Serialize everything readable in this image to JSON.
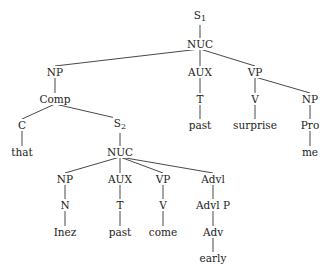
{
  "diagram": {
    "type": "syntax-tree",
    "nodes": [
      {
        "id": "s1",
        "label": "S",
        "sub": "1",
        "x": 200,
        "y": 17
      },
      {
        "id": "nuc1",
        "label": "NUC",
        "x": 200,
        "y": 44
      },
      {
        "id": "np1",
        "label": "NP",
        "x": 55,
        "y": 72
      },
      {
        "id": "aux1",
        "label": "AUX",
        "x": 200,
        "y": 72
      },
      {
        "id": "vp1",
        "label": "VP",
        "x": 255,
        "y": 72
      },
      {
        "id": "comp",
        "label": "Comp",
        "x": 55,
        "y": 99
      },
      {
        "id": "t1",
        "label": "T",
        "x": 200,
        "y": 99
      },
      {
        "id": "v1",
        "label": "V",
        "x": 255,
        "y": 99
      },
      {
        "id": "np2",
        "label": "NP",
        "x": 310,
        "y": 99
      },
      {
        "id": "c",
        "label": "C",
        "x": 22,
        "y": 125
      },
      {
        "id": "s2",
        "label": "S",
        "sub": "2",
        "x": 120,
        "y": 125
      },
      {
        "id": "past1",
        "label": "past",
        "x": 200,
        "y": 125
      },
      {
        "id": "surprise",
        "label": "surprise",
        "x": 255,
        "y": 125
      },
      {
        "id": "pro",
        "label": "Pro",
        "x": 310,
        "y": 125
      },
      {
        "id": "that",
        "label": "that",
        "x": 22,
        "y": 152
      },
      {
        "id": "nuc2",
        "label": "NUC",
        "x": 120,
        "y": 152
      },
      {
        "id": "me",
        "label": "me",
        "x": 310,
        "y": 152
      },
      {
        "id": "np3",
        "label": "NP",
        "x": 65,
        "y": 179
      },
      {
        "id": "aux2",
        "label": "AUX",
        "x": 120,
        "y": 179
      },
      {
        "id": "vp2",
        "label": "VP",
        "x": 163,
        "y": 179
      },
      {
        "id": "advl",
        "label": "Advl",
        "x": 213,
        "y": 179
      },
      {
        "id": "n",
        "label": "N",
        "x": 65,
        "y": 205
      },
      {
        "id": "t2",
        "label": "T",
        "x": 120,
        "y": 205
      },
      {
        "id": "v2",
        "label": "V",
        "x": 163,
        "y": 205
      },
      {
        "id": "advlp",
        "label": "Advl P",
        "x": 213,
        "y": 205
      },
      {
        "id": "inez",
        "label": "Inez",
        "x": 65,
        "y": 232
      },
      {
        "id": "past2",
        "label": "past",
        "x": 120,
        "y": 232
      },
      {
        "id": "come",
        "label": "come",
        "x": 163,
        "y": 232
      },
      {
        "id": "adv",
        "label": "Adv",
        "x": 213,
        "y": 232
      },
      {
        "id": "early",
        "label": "early",
        "x": 213,
        "y": 258
      }
    ],
    "edges": [
      [
        "s1",
        "nuc1"
      ],
      [
        "nuc1",
        "np1"
      ],
      [
        "nuc1",
        "aux1"
      ],
      [
        "nuc1",
        "vp1"
      ],
      [
        "np1",
        "comp"
      ],
      [
        "comp",
        "c"
      ],
      [
        "comp",
        "s2"
      ],
      [
        "aux1",
        "t1"
      ],
      [
        "t1",
        "past1"
      ],
      [
        "vp1",
        "v1"
      ],
      [
        "vp1",
        "np2"
      ],
      [
        "v1",
        "surprise"
      ],
      [
        "np2",
        "pro"
      ],
      [
        "pro",
        "me"
      ],
      [
        "c",
        "that"
      ],
      [
        "s2",
        "nuc2"
      ],
      [
        "nuc2",
        "np3"
      ],
      [
        "nuc2",
        "aux2"
      ],
      [
        "nuc2",
        "vp2"
      ],
      [
        "nuc2",
        "advl"
      ],
      [
        "np3",
        "n"
      ],
      [
        "n",
        "inez"
      ],
      [
        "aux2",
        "t2"
      ],
      [
        "t2",
        "past2"
      ],
      [
        "vp2",
        "v2"
      ],
      [
        "v2",
        "come"
      ],
      [
        "advl",
        "advlp"
      ],
      [
        "advlp",
        "adv"
      ],
      [
        "adv",
        "early"
      ]
    ]
  }
}
